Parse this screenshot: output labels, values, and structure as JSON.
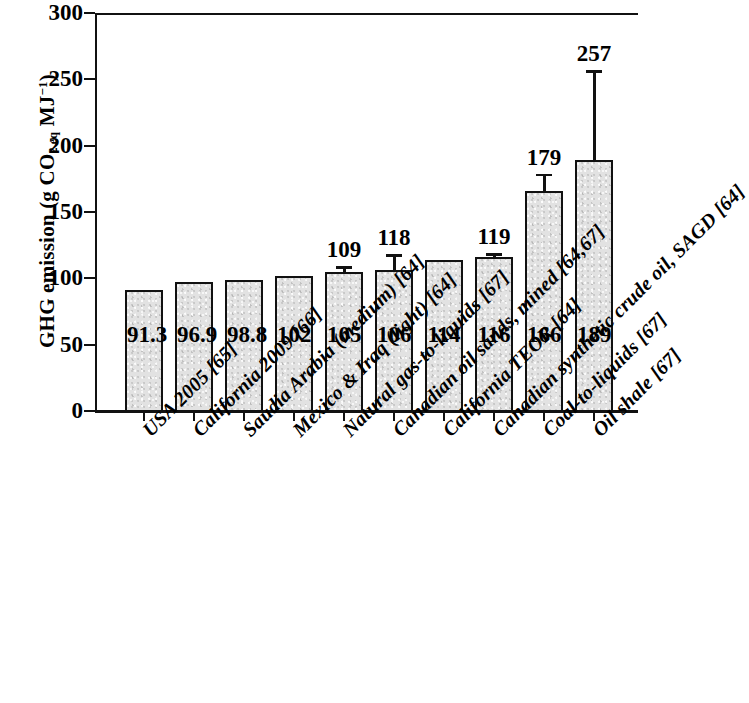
{
  "chart_data": {
    "type": "bar",
    "title": "",
    "xlabel": "",
    "ylabel": "GHG emission (g CO2eq MJ-1)",
    "ylabel_parts": {
      "prefix": "GHG emission (g CO",
      "sub1": "2 eq",
      "mid": " MJ",
      "sup1": "−1",
      "suffix": ")"
    },
    "ylim": [
      0,
      300
    ],
    "yticks": [
      0,
      50,
      100,
      150,
      200,
      250,
      300
    ],
    "ytick_labels": [
      "0",
      "50",
      "100",
      "150",
      "200",
      "250",
      "300"
    ],
    "grid": false,
    "legend": "none",
    "categories": [
      "USA 2005 [65]",
      "California 2009 [66]",
      "Saudia Arabia (medium) [64]",
      "Mexico & Iraq (light) [64]",
      "Natural gas-to-liquids [67]",
      "Canadian oil sands, mined [64,67]",
      "California TEOR [64]",
      "Canadian synthetic crude oil, SAGD [64]",
      "Coal-to-liquids [67]",
      "Oil shale [67]"
    ],
    "values": [
      91.3,
      96.9,
      98.8,
      102,
      105,
      106,
      114,
      116,
      166,
      189
    ],
    "value_labels": [
      "91.3",
      "96.9",
      "98.8",
      "102",
      "105",
      "106",
      "114",
      "116",
      "166",
      "189"
    ],
    "error_high": [
      null,
      null,
      null,
      null,
      109,
      118,
      null,
      119,
      179,
      257
    ],
    "error_high_labels": [
      "",
      "",
      "",
      "",
      "109",
      "118",
      "",
      "119",
      "179",
      "257"
    ],
    "bar_fill_color": "#e2e2e2",
    "bar_edge_color": "#111111"
  }
}
